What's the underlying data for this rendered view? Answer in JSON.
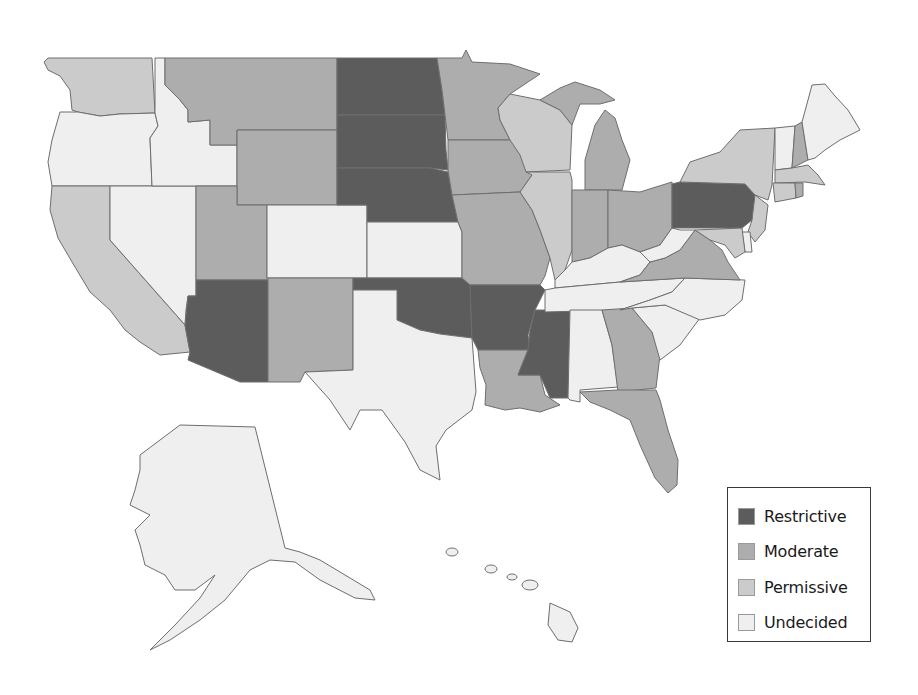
{
  "categories": {
    "restrictive": {
      "label": "Restrictive",
      "color": "#5c5c5c"
    },
    "moderate": {
      "label": "Moderate",
      "color": "#adadad"
    },
    "permissive": {
      "label": "Permissive",
      "color": "#cbcbcb"
    },
    "undecided": {
      "label": "Undecided",
      "color": "#efefef"
    }
  },
  "legend": {
    "items": [
      {
        "key": "restrictive",
        "label": "Restrictive"
      },
      {
        "key": "moderate",
        "label": "Moderate"
      },
      {
        "key": "permissive",
        "label": "Permissive"
      },
      {
        "key": "undecided",
        "label": "Undecided"
      }
    ]
  },
  "states": {
    "WA": "permissive",
    "OR": "undecided",
    "CA": "permissive",
    "NV": "undecided",
    "ID": "undecided",
    "MT": "moderate",
    "WY": "moderate",
    "UT": "moderate",
    "AZ": "restrictive",
    "CO": "undecided",
    "NM": "moderate",
    "ND": "restrictive",
    "SD": "restrictive",
    "NE": "restrictive",
    "KS": "undecided",
    "OK": "restrictive",
    "TX": "undecided",
    "MN": "moderate",
    "IA": "moderate",
    "MO": "moderate",
    "AR": "restrictive",
    "LA": "moderate",
    "WI": "permissive",
    "IL": "permissive",
    "MI": "moderate",
    "IN": "moderate",
    "OH": "moderate",
    "KY": "undecided",
    "TN": "undecided",
    "MS": "restrictive",
    "AL": "undecided",
    "GA": "moderate",
    "FL": "moderate",
    "SC": "undecided",
    "NC": "undecided",
    "VA": "moderate",
    "WV": "undecided",
    "PA": "restrictive",
    "NY": "permissive",
    "NJ": "permissive",
    "DE": "undecided",
    "MD": "permissive",
    "CT": "permissive",
    "RI": "moderate",
    "MA": "permissive",
    "VT": "undecided",
    "NH": "moderate",
    "ME": "undecided",
    "AK": "undecided",
    "HI": "undecided"
  }
}
